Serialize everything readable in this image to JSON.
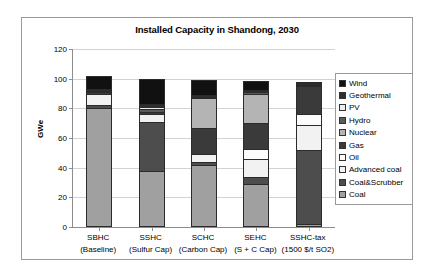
{
  "chart_data": {
    "type": "bar",
    "subtype": "stacked-bar",
    "title": "Installed Capacity in Shandong, 2030",
    "xlabel": "",
    "ylabel": "GWe",
    "ylim": [
      0,
      120
    ],
    "yticks": [
      0,
      20,
      40,
      60,
      80,
      100,
      120
    ],
    "grid": true,
    "legend_position": "right",
    "categories": [
      "SBHC (Baseline)",
      "SSHC (Sulfur Cap)",
      "SCHC (Carbon Cap)",
      "SEHC (S + C Cap)",
      "SSHC-tax (1500 $/t SO2)"
    ],
    "category_lines": [
      {
        "line1": "SBHC",
        "line2": "(Baseline)"
      },
      {
        "line1": "SSHC",
        "line2": "(Sulfur Cap)"
      },
      {
        "line1": "SCHC",
        "line2": "(Carbon Cap)"
      },
      {
        "line1": "SEHC",
        "line2": "(S + C Cap)"
      },
      {
        "line1": "SSHC-tax",
        "line2": "(1500 $/t SO2)"
      }
    ],
    "series": [
      {
        "name": "Coal",
        "color": "#a0a0a0",
        "values": [
          80.0,
          38.0,
          42.0,
          29.0,
          2.0
        ]
      },
      {
        "name": "Coal&Scrubber",
        "color": "#4d4d4d",
        "values": [
          2.5,
          33.0,
          1.5,
          5.0,
          50.0
        ]
      },
      {
        "name": "Advanced coal",
        "color": "#f2f2f2",
        "values": [
          7.0,
          5.0,
          6.0,
          12.0,
          17.0
        ]
      },
      {
        "name": "Oil",
        "color": "#fcfcfc",
        "values": [
          0.0,
          0.0,
          0.0,
          6.5,
          7.0
        ]
      },
      {
        "name": "Gas",
        "color": "#3a3a3a",
        "values": [
          1.5,
          1.5,
          17.0,
          17.5,
          19.0
        ]
      },
      {
        "name": "Nuclear",
        "color": "#b4b4b4",
        "values": [
          0.0,
          0.0,
          20.5,
          20.0,
          0.0
        ]
      },
      {
        "name": "Hydro",
        "color": "#5a5a5a",
        "values": [
          0.5,
          2.0,
          0.5,
          0.5,
          0.5
        ]
      },
      {
        "name": "PV",
        "color": "#ededed",
        "values": [
          0.0,
          1.5,
          0.0,
          0.0,
          0.0
        ]
      },
      {
        "name": "Geothermal",
        "color": "#2e2e2e",
        "values": [
          1.5,
          2.0,
          1.5,
          1.5,
          1.0
        ]
      },
      {
        "name": "Wind",
        "color": "#111111",
        "values": [
          8.5,
          17.0,
          10.0,
          6.0,
          0.5
        ]
      }
    ],
    "totals": [
      102.0,
      100.0,
      99.0,
      98.0,
      97.0
    ]
  },
  "legend": {
    "entries": [
      {
        "label": "Wind",
        "color": "#111111"
      },
      {
        "label": "Geothermal",
        "color": "#2e2e2e"
      },
      {
        "label": "PV",
        "color": "#ededed"
      },
      {
        "label": "Hydro",
        "color": "#5a5a5a"
      },
      {
        "label": "Nuclear",
        "color": "#b4b4b4"
      },
      {
        "label": "Gas",
        "color": "#3a3a3a"
      },
      {
        "label": "Oil",
        "color": "#fcfcfc"
      },
      {
        "label": "Advanced coal",
        "color": "#f2f2f2"
      },
      {
        "label": "Coal&Scrubber",
        "color": "#4d4d4d"
      },
      {
        "label": "Coal",
        "color": "#a0a0a0"
      }
    ]
  }
}
